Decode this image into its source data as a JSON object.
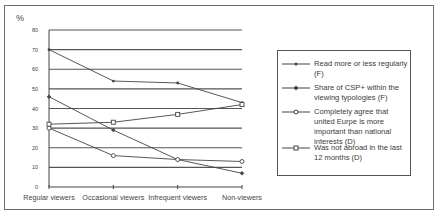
{
  "chart_data": {
    "type": "line",
    "title": "",
    "ylabel": "%",
    "xlabel": "",
    "ylim": [
      0,
      80
    ],
    "yticks": [
      0,
      10,
      20,
      30,
      40,
      50,
      60,
      70,
      80
    ],
    "grid": true,
    "legend_position": "right",
    "categories": [
      "Regular viewers",
      "Occasional viewers",
      "Infrequent viewers",
      "Non-viewers"
    ],
    "series": [
      {
        "name": "Read more or less regularly (F)",
        "marker": "dot",
        "values": [
          70,
          54,
          53,
          43
        ]
      },
      {
        "name": "Share of CSP+ within the viewing typologies (F)",
        "marker": "diamond",
        "values": [
          46,
          29,
          14,
          7
        ]
      },
      {
        "name": "Completely agree that united Europe is more important than national interests (D)",
        "marker": "circle",
        "values": [
          30,
          16,
          14,
          13
        ]
      },
      {
        "name": "Was not abroad in the last 12 months (D)",
        "marker": "square",
        "values": [
          32,
          33,
          37,
          42
        ]
      }
    ]
  },
  "axis": {
    "y_unit": "%",
    "y_tick_labels": [
      "0",
      "10",
      "20",
      "30",
      "40",
      "50",
      "60",
      "70",
      "80"
    ],
    "x_tick_labels": [
      "Regular viewers",
      "Occasional viewers",
      "Infrequent viewers",
      "Non-viewers"
    ]
  },
  "legend": {
    "items": [
      {
        "label": "Read more or less regularly (F)"
      },
      {
        "label": "Share of CSP+ within the viewing typologies (F)"
      },
      {
        "label": "Completely agree that united Eurpe is more important than national interests (D)"
      },
      {
        "label": "Was not abroad in the last 12 months (D)"
      }
    ]
  },
  "colors": {
    "line": "#444444",
    "grid": "#555555",
    "text": "#444444"
  }
}
